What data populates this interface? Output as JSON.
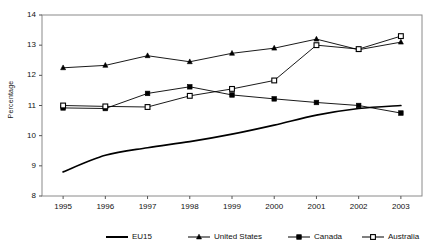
{
  "chart_data": {
    "type": "line",
    "title": "",
    "xlabel": "",
    "ylabel": "Percentage",
    "categories": [
      "1995",
      "1996",
      "1997",
      "1998",
      "1999",
      "2000",
      "2001",
      "2002",
      "2003"
    ],
    "x": [
      1995,
      1996,
      1997,
      1998,
      1999,
      2000,
      2001,
      2002,
      2003
    ],
    "xlim": [
      1994.5,
      2003.5
    ],
    "ylim": [
      8,
      14
    ],
    "yticks": [
      "8",
      "9",
      "10",
      "11",
      "12",
      "13",
      "14"
    ],
    "grid": false,
    "legend_position": "bottom",
    "series": [
      {
        "name": "EU15",
        "marker": "none",
        "color": "#000000",
        "values": [
          8.8,
          9.35,
          9.6,
          9.8,
          10.05,
          10.35,
          10.68,
          10.9,
          11.0
        ]
      },
      {
        "name": "United States",
        "marker": "triangle-filled",
        "color": "#000000",
        "values": [
          12.25,
          12.33,
          12.65,
          12.45,
          12.73,
          12.9,
          13.2,
          12.85,
          13.1
        ]
      },
      {
        "name": "Canada",
        "marker": "square-filled",
        "color": "#000000",
        "values": [
          10.92,
          10.9,
          11.4,
          11.62,
          11.35,
          11.22,
          11.1,
          11.0,
          10.75
        ]
      },
      {
        "name": "Australia",
        "marker": "square-open",
        "color": "#000000",
        "values": [
          11.0,
          10.97,
          10.95,
          11.32,
          11.55,
          11.83,
          13.0,
          12.87,
          13.3
        ]
      }
    ]
  },
  "legend": {
    "items": [
      {
        "label": "EU15",
        "marker": "none"
      },
      {
        "label": "United States",
        "marker": "triangle-filled"
      },
      {
        "label": "Canada",
        "marker": "square-filled"
      },
      {
        "label": "Australia",
        "marker": "square-open"
      }
    ]
  }
}
